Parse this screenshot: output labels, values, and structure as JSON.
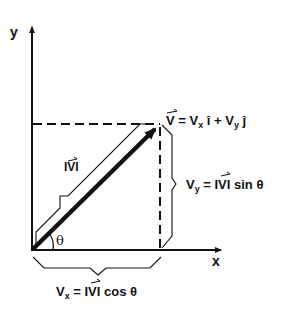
{
  "diagram": {
    "type": "vector-components",
    "axes": {
      "x_label": "x",
      "y_label": "y"
    },
    "vector_label": {
      "V": "V",
      "eq": " = V",
      "sub_x": "x",
      "i": " î + V",
      "sub_y": "y",
      "j": " ĵ"
    },
    "magnitude_label": "|V|",
    "magnitude_text": "IVI",
    "angle_label": "θ",
    "vx_label": {
      "V": "V",
      "sub": "x",
      "rest": " = IVI cos θ"
    },
    "vy_label": {
      "V": "V",
      "sub": "y",
      "rest": " = IVI sin θ"
    },
    "colors": {
      "ink": "#111111",
      "background": "#ffffff"
    }
  }
}
